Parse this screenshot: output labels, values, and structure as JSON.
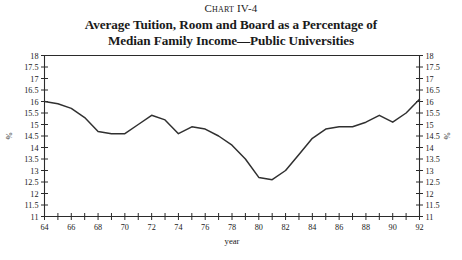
{
  "header": {
    "chart_number": "Chart IV-4",
    "title_line_1": "Average Tuition, Room and Board as a Percentage of",
    "title_line_2": "Median Family Income—Public Universities"
  },
  "chart_data": {
    "type": "line",
    "title": "Average Tuition, Room and Board as a Percentage of Median Family Income—Public Universities",
    "subtitle": "Chart IV-4",
    "xlabel": "year",
    "ylabel": "%",
    "ylabel_right": "%",
    "xlim": [
      64,
      92
    ],
    "ylim": [
      11,
      18
    ],
    "ytick_step": 0.5,
    "grid": false,
    "legend": null,
    "x_tick_labels": [
      "64",
      "66",
      "68",
      "70",
      "72",
      "74",
      "76",
      "78",
      "80",
      "82",
      "84",
      "86",
      "88",
      "90",
      "92"
    ],
    "y_tick_labels": [
      "11",
      "11.5",
      "12",
      "12.5",
      "13",
      "13.5",
      "14",
      "14.5",
      "15",
      "15.5",
      "16",
      "16.5",
      "17",
      "17.5",
      "18"
    ],
    "x": [
      64,
      65,
      66,
      67,
      68,
      69,
      70,
      71,
      72,
      73,
      74,
      75,
      76,
      77,
      78,
      79,
      80,
      81,
      82,
      83,
      84,
      85,
      86,
      87,
      88,
      89,
      90,
      91,
      92
    ],
    "values": [
      16.0,
      15.9,
      15.7,
      15.3,
      14.7,
      14.6,
      14.6,
      15.0,
      15.4,
      15.2,
      14.6,
      14.9,
      14.8,
      14.5,
      14.1,
      13.5,
      12.7,
      12.6,
      13.0,
      13.7,
      14.4,
      14.8,
      14.9,
      14.9,
      15.1,
      15.4,
      15.1,
      15.5,
      16.1
    ]
  }
}
